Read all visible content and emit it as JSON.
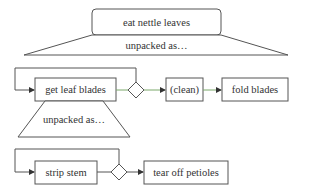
{
  "colors": {
    "stroke": "#555555",
    "connector_active": "#7aa86a",
    "arrowhead": "#333333",
    "text": "#333333",
    "background": "#ffffff"
  },
  "top": {
    "goal": "eat nettle leaves",
    "unpack_label": "unpacked as…"
  },
  "row1": {
    "step1": "get leaf blades",
    "step2": "(clean)",
    "step3": "fold blades",
    "unpack_label": "unpacked as…"
  },
  "row2": {
    "step1": "strip stem",
    "step2": "tear off petioles"
  }
}
